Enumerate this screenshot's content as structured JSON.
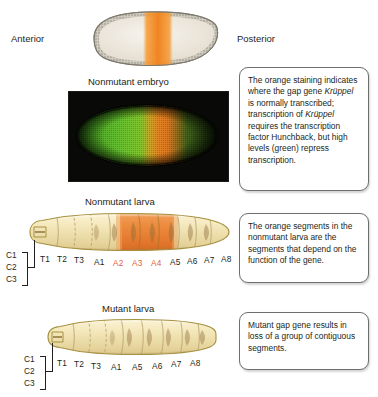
{
  "figure": {
    "orientation": {
      "anterior_label": "Anterior",
      "posterior_label": "Posterior"
    },
    "panels": [
      {
        "id": "embryo-illustration",
        "caption": ""
      },
      {
        "id": "embryo-micrograph",
        "caption": "Nonmutant embryo"
      },
      {
        "id": "nonmutant-larva",
        "caption": "Nonmutant larva"
      },
      {
        "id": "mutant-larva",
        "caption": "Mutant larva"
      }
    ],
    "captions": {
      "embryo_micrograph": "Nonmutant embryo",
      "nonmutant_larva": "Nonmutant larva",
      "mutant_larva": "Mutant larva"
    },
    "callouts": [
      {
        "id": "callout-embryo",
        "text": "The orange staining indicates where the gap gene Krüppel is normally transcribed; transcription of Krüppel requires the transcription factor Hunchback, but high levels (green) repress transcription.",
        "italic_terms": [
          "Krüppel"
        ]
      },
      {
        "id": "callout-nonmutant-larva",
        "text": "The orange segments in the nonmutant larva are the segments that depend on the function of the gene.",
        "italic_terms": []
      },
      {
        "id": "callout-mutant-larva",
        "text": "Mutant gap gene results in loss of a group of contiguous segments.",
        "italic_terms": []
      }
    ],
    "head_bracket": {
      "labels": [
        "C1",
        "C2",
        "C3"
      ],
      "description": "cephalic segments bracket"
    },
    "nonmutant_larva_segments": [
      {
        "label": "T1",
        "highlight": false
      },
      {
        "label": "T2",
        "highlight": false
      },
      {
        "label": "T3",
        "highlight": false
      },
      {
        "label": "A1",
        "highlight": false
      },
      {
        "label": "A2",
        "highlight": true
      },
      {
        "label": "A3",
        "highlight": true
      },
      {
        "label": "A4",
        "highlight": true
      },
      {
        "label": "A5",
        "highlight": false
      },
      {
        "label": "A6",
        "highlight": false
      },
      {
        "label": "A7",
        "highlight": false
      },
      {
        "label": "A8",
        "highlight": false
      }
    ],
    "mutant_larva_segments": [
      {
        "label": "T1",
        "highlight": false
      },
      {
        "label": "T2",
        "highlight": false
      },
      {
        "label": "T3",
        "highlight": false
      },
      {
        "label": "A1",
        "highlight": false
      },
      {
        "label": "A5",
        "highlight": false
      },
      {
        "label": "A6",
        "highlight": false
      },
      {
        "label": "A7",
        "highlight": false
      },
      {
        "label": "A8",
        "highlight": false
      }
    ],
    "missing_segments_in_mutant": [
      "A2",
      "A3",
      "A4"
    ],
    "colors": {
      "highlight_orange": "#e3613a",
      "stain_orange": "#f08421",
      "larva_body": "#f2e3b8",
      "larva_orange_segment": "#e8813c",
      "embryo_interior": "#efe9dd",
      "micrograph_green": "#4fa828",
      "micrograph_background": "#080806",
      "text": "#231f20",
      "callout_border": "#6e6e6e"
    }
  }
}
